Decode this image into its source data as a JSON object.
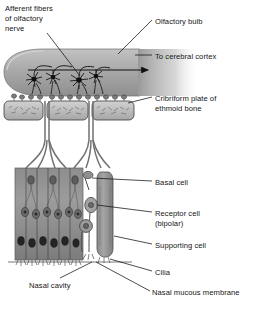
{
  "figure": {
    "type": "anatomical-diagram",
    "background_color": "#ffffff",
    "ink_color": "#151515",
    "tissue_color": "#a8a8a8"
  },
  "labels": [
    {
      "id": "afferent-fibers",
      "text": "Afferent fibers",
      "x": 5,
      "y": 4
    },
    {
      "id": "afferent-fibers-line2",
      "text": "of olfactory",
      "x": 5,
      "y": 14
    },
    {
      "id": "afferent-fibers-line3",
      "text": "nerve",
      "x": 5,
      "y": 24
    },
    {
      "id": "olfactory-bulb",
      "text": "Olfactory bulb",
      "x": 155,
      "y": 17
    },
    {
      "id": "to-cerebral-cortex",
      "text": "To cerebral cortex",
      "x": 155,
      "y": 52
    },
    {
      "id": "cribriform-plate",
      "text": "Cribriform plate of",
      "x": 155,
      "y": 94
    },
    {
      "id": "cribriform-plate-line2",
      "text": "ethmoid bone",
      "x": 155,
      "y": 104
    },
    {
      "id": "basal-cell",
      "text": "Basal cell",
      "x": 155,
      "y": 178
    },
    {
      "id": "receptor-cell",
      "text": "Receptor cell",
      "x": 155,
      "y": 209
    },
    {
      "id": "receptor-cell-line2",
      "text": "(bipolar)",
      "x": 155,
      "y": 219
    },
    {
      "id": "supporting-cell",
      "text": "Supporting cell",
      "x": 155,
      "y": 241
    },
    {
      "id": "cilia",
      "text": "Cilia",
      "x": 155,
      "y": 268
    },
    {
      "id": "nasal-mucous-membrane",
      "text": "Nasal mucous membrane",
      "x": 152,
      "y": 288
    },
    {
      "id": "nasal-cavity",
      "text": "Nasal cavity",
      "x": 29,
      "y": 281
    }
  ],
  "structures": [
    {
      "id": "olfactory-bulb-body",
      "name": "olfactory bulb"
    },
    {
      "id": "mitral-cells",
      "name": "mitral cells",
      "count": 4
    },
    {
      "id": "glomeruli",
      "name": "glomeruli"
    },
    {
      "id": "cribriform-plate-bone",
      "name": "cribriform plate bone segments",
      "count": 3
    },
    {
      "id": "olfactory-nerve-bundles",
      "name": "olfactory nerve fiber bundles",
      "count": 2
    },
    {
      "id": "olfactory-epithelium",
      "name": "olfactory epithelium"
    },
    {
      "id": "detail-receptor-cell",
      "name": "isolated bipolar receptor cell"
    },
    {
      "id": "detail-basal-cell",
      "name": "isolated basal cell"
    },
    {
      "id": "detail-supporting-cell",
      "name": "isolated supporting cell"
    },
    {
      "id": "cilia-layer",
      "name": "cilia layer"
    },
    {
      "id": "cortex-arrow",
      "name": "arrow to cerebral cortex"
    }
  ]
}
